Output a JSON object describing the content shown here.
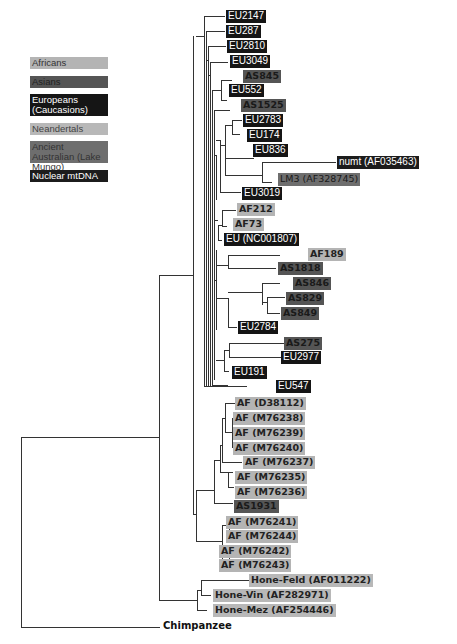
{
  "colors": {
    "africans": "#b4b4b4",
    "asians": "#555555",
    "europeans": "#151515",
    "neandertals": "#b8b8b8",
    "ancient_australian": "#6e6e6e",
    "nuclear_mtdna": "#1c1c1c",
    "branch": "#333333"
  },
  "legend": [
    {
      "key": "africans",
      "label": "Africans"
    },
    {
      "key": "asians",
      "label": "Asians"
    },
    {
      "key": "europeans",
      "label": "Europeans (Caucasions)"
    },
    {
      "key": "neandertals",
      "label": "Neandertals"
    },
    {
      "key": "ancient_australian",
      "label": "Ancient Australian (Lake Mungo)"
    },
    {
      "key": "nuclear_mtdna",
      "label": "Nuclear mtDNA"
    }
  ],
  "leaves": [
    {
      "label": "EU2147",
      "group": "eu"
    },
    {
      "label": "EU287",
      "group": "eu"
    },
    {
      "label": "EU2810",
      "group": "eu"
    },
    {
      "label": "EU3049",
      "group": "eu"
    },
    {
      "label": "AS845",
      "group": "as"
    },
    {
      "label": "EU552",
      "group": "eu"
    },
    {
      "label": "AS1525",
      "group": "as"
    },
    {
      "label": "EU2783",
      "group": "eu"
    },
    {
      "label": "EU174",
      "group": "eu"
    },
    {
      "label": "EU836",
      "group": "eu"
    },
    {
      "label": "numt (AF035463)",
      "group": "nuc"
    },
    {
      "label": "LM3 (AF328745)",
      "group": "au"
    },
    {
      "label": "EU3019",
      "group": "eu"
    },
    {
      "label": "AF212",
      "group": "af"
    },
    {
      "label": "AF73",
      "group": "af"
    },
    {
      "label": "EU (NC001807)",
      "group": "eu"
    },
    {
      "label": "AF189",
      "group": "af"
    },
    {
      "label": "AS1818",
      "group": "as"
    },
    {
      "label": "AS846",
      "group": "as"
    },
    {
      "label": "AS829",
      "group": "as"
    },
    {
      "label": "AS849",
      "group": "as"
    },
    {
      "label": "EU2784",
      "group": "eu"
    },
    {
      "label": "AS275",
      "group": "as"
    },
    {
      "label": "EU2977",
      "group": "eu"
    },
    {
      "label": "EU191",
      "group": "eu"
    },
    {
      "label": "EU547",
      "group": "eu"
    },
    {
      "label": "AF (D38112)",
      "group": "af"
    },
    {
      "label": "AF (M76238)",
      "group": "af"
    },
    {
      "label": "AF (M76239)",
      "group": "af"
    },
    {
      "label": "AF (M76240)",
      "group": "af"
    },
    {
      "label": "AF (M76237)",
      "group": "af"
    },
    {
      "label": "AF (M76235)",
      "group": "af"
    },
    {
      "label": "AF (M76236)",
      "group": "af"
    },
    {
      "label": "AS1931",
      "group": "as"
    },
    {
      "label": "AF (M76241)",
      "group": "af"
    },
    {
      "label": "AF (M76244)",
      "group": "af"
    },
    {
      "label": "AF (M76242)",
      "group": "af"
    },
    {
      "label": "AF (M76243)",
      "group": "af"
    },
    {
      "label": "Hone-Feld (AF011222)",
      "group": "ne"
    },
    {
      "label": "Hone-Vin (AF282971)",
      "group": "ne"
    },
    {
      "label": "Hone-Mez (AF254446)",
      "group": "ne"
    }
  ],
  "outgroup": {
    "label": "Chimpanzee"
  }
}
